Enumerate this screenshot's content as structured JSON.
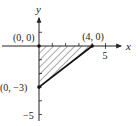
{
  "chart_data": {
    "type": "area",
    "title": "",
    "xlabel": "x",
    "ylabel": "y",
    "xlim": [
      -2.5,
      6
    ],
    "ylim": [
      -6,
      2.5
    ],
    "x_ticks": [
      1,
      2,
      3,
      4,
      5
    ],
    "y_ticks": [
      1,
      -1,
      -2,
      -3,
      -4,
      -5
    ],
    "tick_labels": {
      "x": [
        {
          "value": 5,
          "label": "5"
        }
      ],
      "y": [
        {
          "value": -5,
          "label": "−5"
        }
      ]
    },
    "region": {
      "description": "shaded triangular region",
      "fill": "hatched",
      "vertices": [
        [
          0,
          0
        ],
        [
          4,
          0
        ],
        [
          0,
          -3
        ]
      ]
    },
    "points": [
      {
        "x": 0,
        "y": 0,
        "label": "(0, 0)"
      },
      {
        "x": 4,
        "y": 0,
        "label": "(4, 0)"
      },
      {
        "x": 0,
        "y": -3,
        "label": "(0, −3)"
      }
    ],
    "bold_edge": [
      [
        0,
        -3
      ],
      [
        4,
        0
      ]
    ],
    "grid": false,
    "colors": {
      "ink": "#222222",
      "hatch": "#444444"
    }
  }
}
